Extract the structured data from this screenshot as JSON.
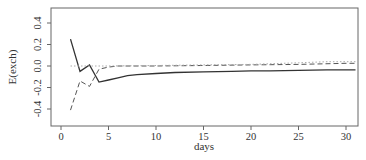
{
  "chart_data": {
    "type": "line",
    "title": "",
    "xlabel": "days",
    "ylabel": "E(exch)",
    "xlim": [
      -1,
      31
    ],
    "ylim": [
      -0.5,
      0.55
    ],
    "xticks": [
      0,
      5,
      10,
      15,
      20,
      25,
      30
    ],
    "xtick_labels": [
      "0",
      "5",
      "10",
      "15",
      "20",
      "25",
      "30"
    ],
    "yticks": [
      -0.4,
      -0.2,
      0.0,
      0.2,
      0.4
    ],
    "ytick_labels": [
      "-0.4",
      "-0.2",
      "0.0",
      "0.2",
      "0.4"
    ],
    "grid": false,
    "legend": null,
    "series": [
      {
        "name": "solid",
        "style": "solid",
        "color": "#333333",
        "x": [
          1,
          2,
          3,
          4,
          5,
          6,
          7,
          8,
          10,
          12,
          15,
          18,
          20,
          22,
          25,
          28,
          30,
          31
        ],
        "values": [
          0.25,
          -0.05,
          0.01,
          -0.15,
          -0.13,
          -0.11,
          -0.09,
          -0.08,
          -0.07,
          -0.06,
          -0.055,
          -0.05,
          -0.045,
          -0.045,
          -0.04,
          -0.035,
          -0.035,
          -0.035
        ]
      },
      {
        "name": "dashed",
        "style": "dashed",
        "color": "#555555",
        "x": [
          1,
          2,
          3,
          4,
          5,
          6,
          8,
          10,
          15,
          20,
          25,
          30,
          31
        ],
        "values": [
          -0.41,
          -0.14,
          -0.19,
          -0.03,
          -0.01,
          0.0,
          0.0,
          0.0,
          0.005,
          0.01,
          0.015,
          0.025,
          0.025
        ]
      },
      {
        "name": "dotted",
        "style": "dotted",
        "color": "#aaaaaa",
        "x": [
          1,
          2,
          3,
          4,
          5,
          10,
          15,
          20,
          25,
          28,
          30,
          31
        ],
        "values": [
          0.0,
          0.0,
          0.0,
          0.0,
          0.0,
          0.005,
          0.01,
          0.015,
          0.03,
          0.04,
          0.04,
          0.04
        ]
      }
    ]
  }
}
